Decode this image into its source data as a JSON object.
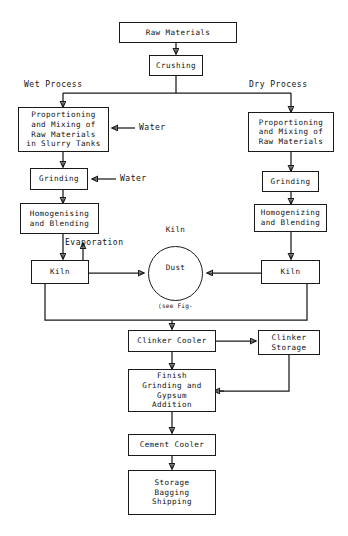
{
  "diagram": {
    "stroke_color": "#1a1a1a",
    "background_color": "#ffffff"
  },
  "branch_labels": {
    "wet": "Wet Process",
    "dry": "Dry Process"
  },
  "annotations": {
    "water_slurry": "Water",
    "water_grinding": "Water",
    "evaporation": "Evaporation"
  },
  "nodes": {
    "raw_materials": "Raw Materials",
    "crushing": "Crushing",
    "wet_proportioning": "Proportioning\nand Mixing of\nRaw Materials\nin Slurry Tanks",
    "wet_grinding": "Grinding",
    "wet_homogenizing": "Homogenising\nand Blending",
    "wet_kiln": "Kiln",
    "dry_proportioning": "Proportioning\nand Mixing of\nRaw Materials",
    "dry_grinding": "Grinding",
    "dry_homogenizing": "Homogenizing\nand Blending",
    "dry_kiln": "Kiln",
    "kiln_dust_line1": "Kiln",
    "kiln_dust_line2": "Dust",
    "kiln_dust_line3": "(see Fig-",
    "kiln_dust_line4": "ure 2B)",
    "clinker_cooler": "Clinker Cooler",
    "clinker_storage": "Clinker\nStorage",
    "finish_grinding": "Finish\nGrinding and\nGypsum\nAddition",
    "cement_cooler": "Cement Cooler",
    "storage_bagging": "Storage\nBagging\nShipping"
  }
}
